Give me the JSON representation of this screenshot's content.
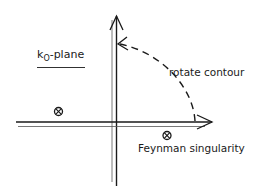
{
  "diagram": {
    "plane_label": {
      "main": "k",
      "subscript": "O",
      "suffix": "-plane"
    },
    "rotate_label": "rotate contour",
    "singularity_label": "Feynman singularity",
    "singularity_symbol": "⊗",
    "icons": {
      "singularity": "circled-x-icon",
      "arrow": "arrowhead-icon"
    },
    "colors": {
      "ink": "#1a1a1a",
      "background": "#ffffff"
    }
  }
}
